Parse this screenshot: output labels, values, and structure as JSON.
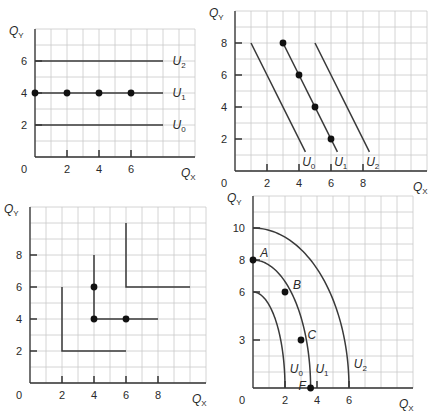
{
  "chart_data": [
    {
      "id": "panel-a",
      "type": "line",
      "title": "",
      "xlabel": "Q_X",
      "ylabel": "Q_Y",
      "x_ticks": [
        2,
        4,
        6
      ],
      "y_ticks": [
        2,
        4,
        6
      ],
      "origin_label": "0",
      "xlim": [
        0,
        10
      ],
      "ylim": [
        0,
        8
      ],
      "grid": true,
      "frame": {
        "x0": 35,
        "y0": 157,
        "px_per_unit": 16,
        "cols": 10,
        "rows": 8
      },
      "series": [
        {
          "name": "U2",
          "points": [
            [
              0,
              6
            ],
            [
              8,
              6
            ]
          ]
        },
        {
          "name": "U1",
          "points": [
            [
              0,
              4
            ],
            [
              8,
              4
            ]
          ],
          "markers": [
            [
              0,
              4
            ],
            [
              2,
              4
            ],
            [
              4,
              4
            ],
            [
              6,
              4
            ]
          ]
        },
        {
          "name": "U0",
          "points": [
            [
              0,
              2
            ],
            [
              8,
              2
            ]
          ]
        }
      ],
      "labels": [
        {
          "text": "U",
          "sub": "2",
          "x": 8.6,
          "y": 6
        },
        {
          "text": "U",
          "sub": "1",
          "x": 8.6,
          "y": 4
        },
        {
          "text": "U",
          "sub": "0",
          "x": 8.6,
          "y": 2
        }
      ]
    },
    {
      "id": "panel-b",
      "type": "line",
      "title": "",
      "xlabel": "Q_X",
      "ylabel": "Q_Y",
      "x_ticks": [
        2,
        4,
        6,
        8
      ],
      "y_ticks": [
        2,
        4,
        6,
        8
      ],
      "origin_label": "0",
      "xlim": [
        0,
        12
      ],
      "ylim": [
        0,
        10
      ],
      "grid": true,
      "frame": {
        "x0": 235,
        "y0": 171,
        "px_per_unit": 16,
        "cols": 12,
        "rows": 10
      },
      "series": [
        {
          "name": "U0",
          "points": [
            [
              1,
              8
            ],
            [
              4.4,
              1.2
            ]
          ]
        },
        {
          "name": "U1",
          "points": [
            [
              3,
              8
            ],
            [
              6.4,
              1.2
            ]
          ],
          "markers": [
            [
              3,
              8
            ],
            [
              4,
              6
            ],
            [
              5,
              4
            ],
            [
              6,
              2
            ]
          ]
        },
        {
          "name": "U2",
          "points": [
            [
              5,
              8
            ],
            [
              8.4,
              1.2
            ]
          ]
        }
      ],
      "labels": [
        {
          "text": "U",
          "sub": "0",
          "x": 4.2,
          "y": 0.55
        },
        {
          "text": "U",
          "sub": "1",
          "x": 6.2,
          "y": 0.55
        },
        {
          "text": "U",
          "sub": "2",
          "x": 8.2,
          "y": 0.55
        }
      ]
    },
    {
      "id": "panel-c",
      "type": "line",
      "title": "",
      "xlabel": "Q_X",
      "ylabel": "Q_Y",
      "x_ticks": [
        2,
        4,
        6,
        8
      ],
      "y_ticks": [
        2,
        4,
        6,
        8
      ],
      "origin_label": "0",
      "xlim": [
        0,
        11
      ],
      "ylim": [
        0,
        11
      ],
      "grid": true,
      "frame": {
        "x0": 30,
        "y0": 383,
        "px_per_unit": 16,
        "cols": 11,
        "rows": 11
      },
      "series": [
        {
          "name": "U0",
          "points": [
            [
              2,
              6
            ],
            [
              2,
              2
            ],
            [
              6,
              2
            ]
          ]
        },
        {
          "name": "U1",
          "points": [
            [
              4,
              8
            ],
            [
              4,
              4
            ],
            [
              8,
              4
            ]
          ],
          "markers": [
            [
              4,
              6
            ],
            [
              4,
              4
            ],
            [
              6,
              4
            ]
          ]
        },
        {
          "name": "U2",
          "points": [
            [
              6,
              10
            ],
            [
              6,
              6
            ],
            [
              10,
              6
            ]
          ]
        }
      ],
      "labels": []
    },
    {
      "id": "panel-d",
      "type": "line",
      "title": "",
      "xlabel": "Q_X",
      "ylabel": "Q_Y",
      "x_ticks": [
        2,
        4,
        6
      ],
      "y_ticks": [
        3,
        6,
        8,
        10
      ],
      "origin_label": "0",
      "xlim": [
        0,
        10
      ],
      "ylim": [
        0,
        12
      ],
      "grid": true,
      "frame": {
        "x0": 253,
        "y0": 388,
        "px_per_unit": 16,
        "cols": 10,
        "rows": 12
      },
      "series": [
        {
          "name": "U0",
          "quarter_ellipse": {
            "a": 2,
            "b": 6
          }
        },
        {
          "name": "U1",
          "quarter_ellipse": {
            "a": 3.6,
            "b": 8
          },
          "markers": [
            [
              0,
              8
            ],
            [
              2,
              6
            ],
            [
              3,
              3
            ],
            [
              3.6,
              0
            ]
          ]
        },
        {
          "name": "U2",
          "quarter_ellipse": {
            "a": 6,
            "b": 10
          }
        }
      ],
      "point_labels": [
        {
          "text": "A",
          "x": 0.45,
          "y": 8.45
        },
        {
          "text": "B",
          "x": 2.5,
          "y": 6.45
        },
        {
          "text": "C",
          "x": 3.4,
          "y": 3.3
        },
        {
          "text": "F",
          "x": 2.85,
          "y": 0.15
        }
      ],
      "labels": [
        {
          "text": "U",
          "sub": "0",
          "x": 2.3,
          "y": 1.2
        },
        {
          "text": "U",
          "sub": "1",
          "x": 3.9,
          "y": 1.2
        },
        {
          "text": "U",
          "sub": "2",
          "x": 6.3,
          "y": 1.5
        }
      ]
    }
  ]
}
